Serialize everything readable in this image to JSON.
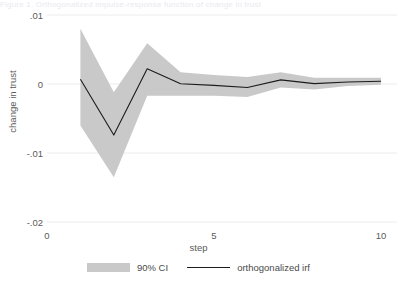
{
  "topstrip": {
    "text": "Figure 1. Orthogonalized impulse-response function of change in trust"
  },
  "axes": {
    "ylabel": "change in trust",
    "xlabel": "step",
    "yticks": [
      "-.02",
      "-.01",
      "0",
      ".01"
    ],
    "xticks": [
      "0",
      "5",
      "10"
    ]
  },
  "legend": {
    "items": [
      {
        "label": "90% CI",
        "marker": "band-swatch",
        "color": "#c9c9c9"
      },
      {
        "label": "orthogonalized irf",
        "marker": "line-swatch",
        "color": "#1c1c1c"
      }
    ]
  },
  "chart_data": {
    "type": "line",
    "title": "",
    "subtitle": "",
    "xlabel": "step",
    "ylabel": "change in trust",
    "xlim": [
      0,
      10
    ],
    "ylim": [
      -0.02,
      0.01
    ],
    "xticks": [
      0,
      5,
      10
    ],
    "yticks": [
      -0.02,
      -0.01,
      0,
      0.01
    ],
    "grid": "horizontal",
    "legend_position": "bottom",
    "x": [
      1,
      2,
      3,
      4,
      5,
      6,
      7,
      8,
      9,
      10
    ],
    "series": [
      {
        "name": "orthogonalized irf",
        "type": "line",
        "color": "#1c1c1c",
        "values": [
          0.0007,
          -0.0074,
          0.0022,
          3e-05,
          -0.0002,
          -0.0005,
          0.0006,
          5e-05,
          0.0003,
          0.0004
        ]
      },
      {
        "name": "90% CI upper",
        "type": "band-upper",
        "color": "#c9c9c9",
        "values": [
          0.008,
          -0.0012,
          0.0059,
          0.0017,
          0.0013,
          0.001,
          0.0017,
          0.0009,
          0.0009,
          0.0009
        ]
      },
      {
        "name": "90% CI lower",
        "type": "band-lower",
        "color": "#c9c9c9",
        "values": [
          -0.006,
          -0.0135,
          -0.0017,
          -0.0017,
          -0.0017,
          -0.0019,
          -0.0005,
          -0.0008,
          -0.0003,
          -0.0001
        ]
      }
    ],
    "annotations": []
  },
  "style": {
    "band_color": "#c9c9c9",
    "line_color": "#1c1c1c",
    "grid_color": "#ececec",
    "text_color": "#5a5a5a",
    "background": "#ffffff"
  }
}
